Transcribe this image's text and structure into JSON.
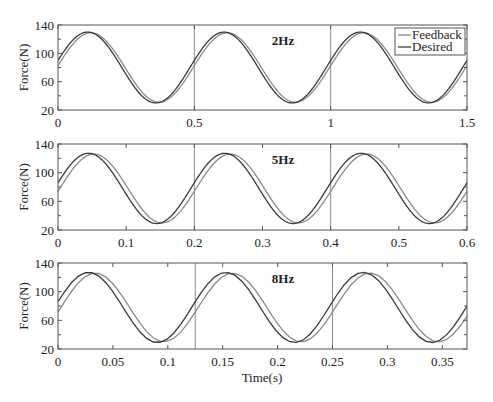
{
  "figure": {
    "xlabel": "Time(s)",
    "ylabel": "Force(N)",
    "legend": [
      {
        "label": "Feedback",
        "color": "#8a8a8a"
      },
      {
        "label": "Desired",
        "color": "#3a3a3a"
      }
    ]
  },
  "chart_data": [
    {
      "type": "line",
      "title": "2Hz",
      "xlabel": "",
      "ylabel": "Force(N)",
      "xlim": [
        0,
        1.5
      ],
      "ylim": [
        20,
        140
      ],
      "xticks": [
        0,
        0.5,
        1,
        1.5
      ],
      "xtick_labels": [
        "0",
        "0.5",
        "1",
        "1.5"
      ],
      "yticks": [
        20,
        60,
        100,
        140
      ],
      "ytick_labels": [
        "20",
        "60",
        "100",
        "140"
      ],
      "vlines": [
        0.5,
        1.0
      ],
      "frequency_hz": 2,
      "legend_position": "upper right",
      "grid": false,
      "series": [
        {
          "name": "Desired",
          "amplitude": 50,
          "offset": 80,
          "phase_shift_s": 0,
          "min": 30,
          "max": 130
        },
        {
          "name": "Feedback",
          "amplitude": 49,
          "offset": 80,
          "phase_shift_s": 0.012,
          "min": 31,
          "max": 129
        }
      ]
    },
    {
      "type": "line",
      "title": "5Hz",
      "xlabel": "",
      "ylabel": "Force(N)",
      "xlim": [
        0,
        0.6
      ],
      "ylim": [
        20,
        140
      ],
      "xticks": [
        0,
        0.1,
        0.2,
        0.3,
        0.4,
        0.5,
        0.6
      ],
      "xtick_labels": [
        "0",
        "0.1",
        "0.2",
        "0.3",
        "0.4",
        "0.5",
        "0.6"
      ],
      "yticks": [
        20,
        60,
        100,
        140
      ],
      "ytick_labels": [
        "20",
        "60",
        "100",
        "140"
      ],
      "vlines": [
        0.2,
        0.4
      ],
      "frequency_hz": 5,
      "grid": false,
      "series": [
        {
          "name": "Desired",
          "amplitude": 49,
          "offset": 78,
          "phase_shift_s": 0,
          "min": 29,
          "max": 127
        },
        {
          "name": "Feedback",
          "amplitude": 48,
          "offset": 78,
          "phase_shift_s": 0.008,
          "min": 30,
          "max": 126
        }
      ]
    },
    {
      "type": "line",
      "title": "8Hz",
      "xlabel": "Time(s)",
      "ylabel": "Force(N)",
      "xlim": [
        0,
        0.3725
      ],
      "ylim": [
        20,
        140
      ],
      "xticks": [
        0,
        0.05,
        0.1,
        0.15,
        0.2,
        0.25,
        0.3,
        0.35
      ],
      "xtick_labels": [
        "0",
        "0.05",
        "0.1",
        "0.15",
        "0.2",
        "0.25",
        "0.3",
        "0.35"
      ],
      "yticks": [
        20,
        60,
        100,
        140
      ],
      "ytick_labels": [
        "20",
        "60",
        "100",
        "140"
      ],
      "vlines": [
        0.125,
        0.25
      ],
      "frequency_hz": 8,
      "grid": false,
      "series": [
        {
          "name": "Desired",
          "amplitude": 49,
          "offset": 78,
          "phase_shift_s": 0,
          "min": 29,
          "max": 127
        },
        {
          "name": "Feedback",
          "amplitude": 48,
          "offset": 78,
          "phase_shift_s": 0.006,
          "min": 30,
          "max": 126
        }
      ]
    }
  ]
}
